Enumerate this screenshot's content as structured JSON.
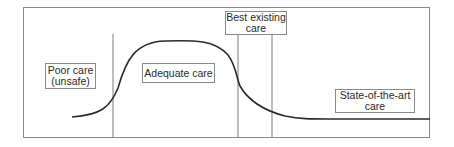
{
  "diagram": {
    "type": "care-quality-curve",
    "regions": [
      {
        "id": "poor",
        "lines": [
          "Poor care",
          "(unsafe)"
        ]
      },
      {
        "id": "adequate",
        "lines": [
          "Adequate care"
        ]
      },
      {
        "id": "best",
        "lines": [
          "Best existing",
          "care"
        ]
      },
      {
        "id": "state",
        "lines": [
          "State-of-the-art",
          "care"
        ]
      }
    ],
    "colors": {
      "frame": "#8a8a8a",
      "divider": "#7a7a7a",
      "curve": "#2b2b2b",
      "text": "#2a2a2a",
      "background": "#ffffff"
    }
  }
}
